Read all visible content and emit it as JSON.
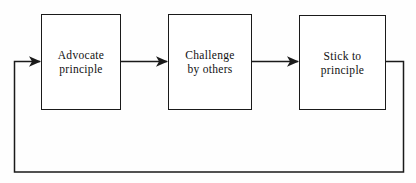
{
  "diagram": {
    "type": "cyclic-flowchart",
    "title": "",
    "background_color": "#fefefe",
    "line_color": "#1a1a1a",
    "text_color": "#111111",
    "boxes": [
      {
        "id": "advocate",
        "line1": "Advocate",
        "line2": "principle"
      },
      {
        "id": "challenge",
        "line1": "Challenge",
        "line2": "by others"
      },
      {
        "id": "stick",
        "line1": "Stick to",
        "line2": "principle"
      }
    ],
    "connectors": [
      {
        "id": "advocate-to-challenge",
        "from": "advocate",
        "to": "challenge",
        "style": "straight-arrow",
        "label": ""
      },
      {
        "id": "challenge-to-stick",
        "from": "challenge",
        "to": "stick",
        "style": "straight-arrow",
        "label": ""
      },
      {
        "id": "stick-to-advocate-feedback",
        "from": "stick",
        "to": "advocate",
        "style": "feedback-loop-below",
        "label": ""
      }
    ]
  }
}
